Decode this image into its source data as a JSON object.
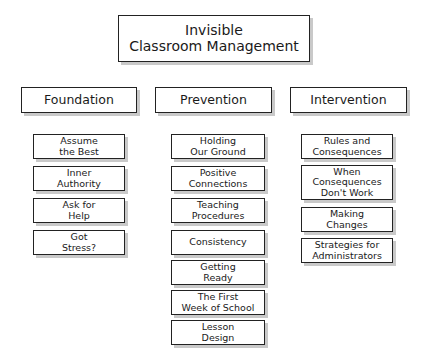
{
  "title": {
    "line1": "Invisible",
    "line2": "Classroom Management"
  },
  "columns": [
    {
      "id": "foundation",
      "header": "Foundation",
      "items": [
        {
          "line1": "Assume",
          "line2": "the Best",
          "top": 134,
          "lines": 2
        },
        {
          "line1": "Inner",
          "line2": "Authority",
          "top": 166,
          "lines": 2
        },
        {
          "line1": "Ask for",
          "line2": "Help",
          "top": 198,
          "lines": 2
        },
        {
          "line1": "Got",
          "line2": "Stress?",
          "top": 230,
          "lines": 2
        }
      ]
    },
    {
      "id": "prevention",
      "header": "Prevention",
      "items": [
        {
          "line1": "Holding",
          "line2": "Our Ground",
          "top": 134,
          "lines": 2
        },
        {
          "line1": "Positive",
          "line2": "Connections",
          "top": 166,
          "lines": 2
        },
        {
          "line1": "Teaching",
          "line2": "Procedures",
          "top": 198,
          "lines": 2
        },
        {
          "line1": "Consistency",
          "line2": "",
          "top": 230,
          "lines": 1
        },
        {
          "line1": "Getting",
          "line2": "Ready",
          "top": 260,
          "lines": 2
        },
        {
          "line1": "The First",
          "line2": "Week of School",
          "top": 290,
          "lines": 2
        },
        {
          "line1": "Lesson",
          "line2": "Design",
          "top": 320,
          "lines": 2
        }
      ]
    },
    {
      "id": "intervention",
      "header": "Intervention",
      "items": [
        {
          "line1": "Rules and",
          "line2": "Consequences",
          "top": 134,
          "lines": 2
        },
        {
          "line1": "When",
          "line2": "Consequences",
          "line3": "Don't Work",
          "top": 165,
          "lines": 3
        },
        {
          "line1": "Making",
          "line2": "Changes",
          "top": 207,
          "lines": 2
        },
        {
          "line1": "Strategies for",
          "line2": "Administrators",
          "top": 238,
          "lines": 2
        }
      ]
    }
  ],
  "colors": {
    "background": "#ffffff",
    "border": "#222222",
    "shadow": "#c9c9c9",
    "text": "#1a1a1a"
  }
}
